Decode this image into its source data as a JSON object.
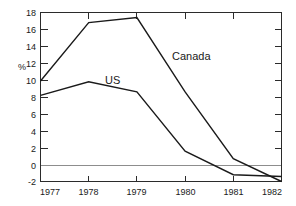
{
  "chart_data": {
    "type": "line",
    "title": "",
    "xlabel": "",
    "ylabel": "%",
    "x": [
      "1977",
      "1978",
      "1979",
      "1980",
      "1981",
      "1982"
    ],
    "categories": [
      "1977",
      "1978",
      "1979",
      "1980",
      "1981",
      "1982"
    ],
    "series": [
      {
        "name": "Canada",
        "values": [
          9.9,
          16.8,
          17.4,
          8.6,
          0.7,
          -2.0
        ]
      },
      {
        "name": "US",
        "values": [
          8.2,
          9.8,
          8.6,
          1.6,
          -1.2,
          -1.4
        ]
      }
    ],
    "ylim": [
      -2,
      18
    ],
    "yticks": [
      -2,
      0,
      2,
      4,
      6,
      8,
      10,
      12,
      14,
      16,
      18
    ],
    "ytick_labels": [
      "-2",
      "0",
      "2",
      "4",
      "6",
      "8",
      "10",
      "12",
      "14",
      "16",
      "18"
    ],
    "xtick_labels": [
      "1977",
      "1978",
      "1979",
      "1980",
      "1981",
      "1982"
    ],
    "grid": false,
    "legend_position": "inline-annotations",
    "annotations": [
      {
        "text": "Canada",
        "series": "Canada",
        "x_value": 1980.05,
        "y_value": 12.3
      },
      {
        "text": "US",
        "series": "US",
        "x_value": 1978.75,
        "y_value": 10.2
      }
    ],
    "zero_line": 0,
    "colors": {
      "line": "#1a1a1a",
      "frame": "#2b2b2b",
      "zero_line": "#8d8d8d",
      "background": "#ffffff"
    }
  },
  "axis": {
    "y_title": "%",
    "y_ticks": [
      "18",
      "16",
      "14",
      "12",
      "10",
      "8",
      "6",
      "4",
      "2",
      "0",
      "-2"
    ],
    "x_ticks": [
      "1977",
      "1978",
      "1979",
      "1980",
      "1981",
      "1982"
    ]
  },
  "labels": {
    "canada": "Canada",
    "us": "US"
  }
}
